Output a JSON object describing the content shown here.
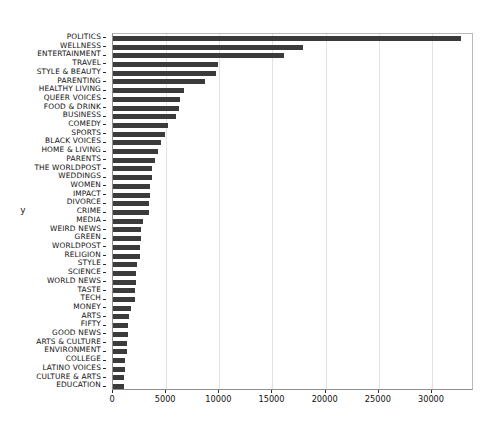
{
  "chart_data": {
    "type": "bar",
    "orientation": "horizontal",
    "title": "",
    "xlabel": "",
    "ylabel": "y",
    "xlim": [
      0,
      33950
    ],
    "grid": "vertical",
    "legend": "none",
    "bar_color": "#3b3b3b",
    "xticks": [
      0,
      5000,
      10000,
      15000,
      20000,
      25000,
      30000
    ],
    "xtick_labels": [
      "0",
      "5000",
      "10000",
      "15000",
      "20000",
      "25000",
      "30000"
    ],
    "categories": [
      "POLITICS",
      "WELLNESS",
      "ENTERTAINMENT",
      "TRAVEL",
      "STYLE & BEAUTY",
      "PARENTING",
      "HEALTHY LIVING",
      "QUEER VOICES",
      "FOOD & DRINK",
      "BUSINESS",
      "COMEDY",
      "SPORTS",
      "BLACK VOICES",
      "HOME & LIVING",
      "PARENTS",
      "THE WORLDPOST",
      "WEDDINGS",
      "WOMEN",
      "IMPACT",
      "DIVORCE",
      "CRIME",
      "MEDIA",
      "WEIRD NEWS",
      "GREEN",
      "WORLDPOST",
      "RELIGION",
      "STYLE",
      "SCIENCE",
      "WORLD NEWS",
      "TASTE",
      "TECH",
      "MONEY",
      "ARTS",
      "FIFTY",
      "GOOD NEWS",
      "ARTS & CULTURE",
      "ENVIRONMENT",
      "COLLEGE",
      "LATINO VOICES",
      "CULTURE & ARTS",
      "EDUCATION"
    ],
    "values": [
      32739,
      17827,
      16058,
      9887,
      9649,
      8677,
      6694,
      6314,
      6226,
      5937,
      5175,
      4884,
      4528,
      4195,
      3955,
      3664,
      3651,
      3490,
      3459,
      3426,
      3405,
      2815,
      2670,
      2622,
      2579,
      2556,
      2254,
      2178,
      2177,
      2096,
      2082,
      1707,
      1509,
      1401,
      1398,
      1339,
      1323,
      1144,
      1130,
      1030,
      1004
    ]
  }
}
